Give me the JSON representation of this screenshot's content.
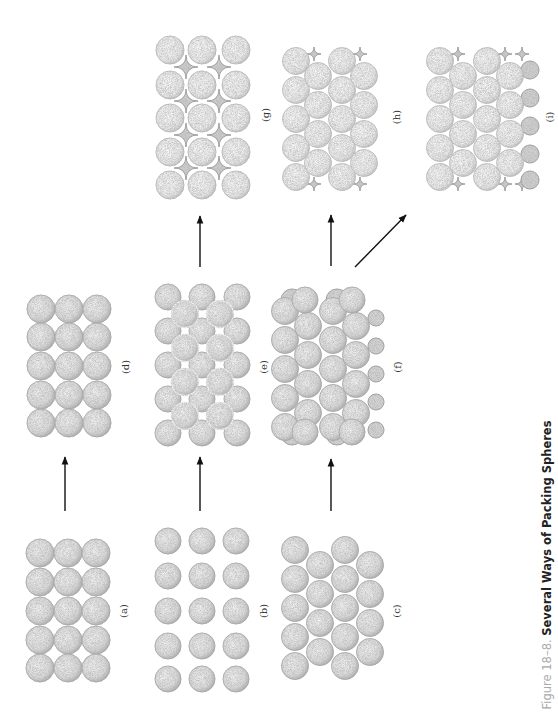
{
  "figure": {
    "number_label": "Figure 18–8.",
    "title": "Several Ways of Packing Spheres"
  },
  "colors": {
    "sphere_stroke": "#9a9a9a",
    "sphere_fill": "#e6e6e6",
    "sphere_fill_light": "#f0f0f0",
    "void_fill": "#c8c8c8",
    "arrow": "#111111",
    "caption_number": "#aaaaaa",
    "caption_title": "#222222"
  },
  "panels": [
    {
      "id": "a",
      "label": "(a)",
      "description": "simple square layer, touching spheres",
      "label_pos": [
        123,
        611
      ]
    },
    {
      "id": "b",
      "label": "(b)",
      "description": "square array, separated spheres",
      "label_pos": [
        263,
        611
      ]
    },
    {
      "id": "c",
      "label": "(c)",
      "description": "hexagonal close-packed layer",
      "label_pos": [
        396,
        611
      ]
    },
    {
      "id": "d",
      "label": "(d)",
      "description": "simple cubic stacking",
      "label_pos": [
        125,
        367
      ]
    },
    {
      "id": "e",
      "label": "(e)",
      "description": "second layer in hollows of square layer",
      "label_pos": [
        263,
        367
      ]
    },
    {
      "id": "f",
      "label": "(f)",
      "description": "second hexagonal layer on first",
      "label_pos": [
        397,
        367
      ]
    },
    {
      "id": "g",
      "label": "(g)",
      "description": "body-centered / face-centered view with voids",
      "label_pos": [
        265,
        115
      ]
    },
    {
      "id": "h",
      "label": "(h)",
      "description": "hexagonal close packing (ABAB)",
      "label_pos": [
        396,
        117
      ]
    },
    {
      "id": "i",
      "label": "(i)",
      "description": "cubic close packing (ABCABC)",
      "label_pos": [
        549,
        117
      ]
    }
  ],
  "arrows": [
    {
      "from": "a",
      "to": "d"
    },
    {
      "from": "b",
      "to": "e"
    },
    {
      "from": "c",
      "to": "f"
    },
    {
      "from": "e",
      "to": "g"
    },
    {
      "from": "f",
      "to": "h"
    },
    {
      "from": "f",
      "to": "i"
    }
  ]
}
